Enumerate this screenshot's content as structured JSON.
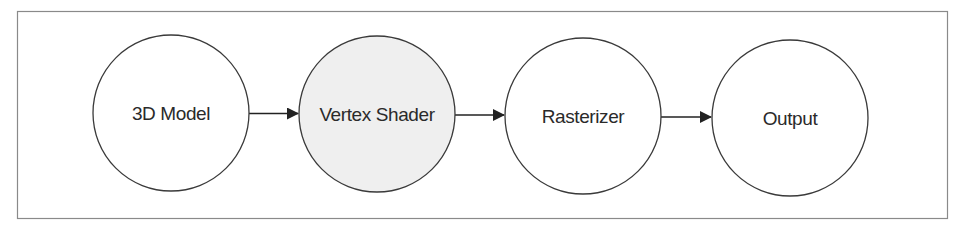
{
  "diagram": {
    "type": "flowchart",
    "direction": "left-to-right",
    "colors": {
      "frame_stroke": "#8a8a8a",
      "node_stroke": "#3a3a3a",
      "node_fill_default": "#ffffff",
      "node_fill_highlight": "#efefef",
      "arrow": "#222222",
      "text": "#2a2a2a"
    },
    "nodes": [
      {
        "id": "model",
        "label": "3D Model",
        "highlighted": false
      },
      {
        "id": "vertex",
        "label": "Vertex Shader",
        "highlighted": true
      },
      {
        "id": "raster",
        "label": "Rasterizer",
        "highlighted": false
      },
      {
        "id": "output",
        "label": "Output",
        "highlighted": false
      }
    ],
    "edges": [
      {
        "from": "model",
        "to": "vertex"
      },
      {
        "from": "vertex",
        "to": "raster"
      },
      {
        "from": "raster",
        "to": "output"
      }
    ]
  }
}
